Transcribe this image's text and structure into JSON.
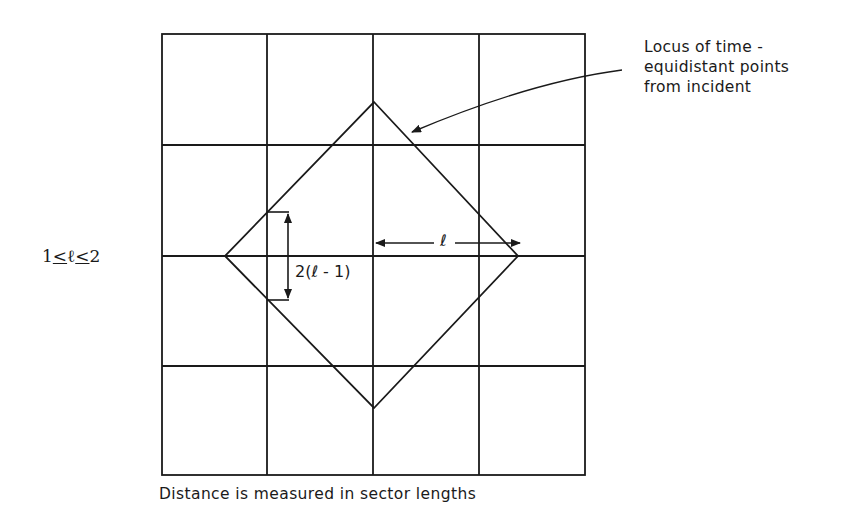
{
  "diagram": {
    "grid": {
      "columns": 4,
      "rows": 4,
      "line_color": "#1a1a1a",
      "x_lines": [
        162,
        267,
        373,
        479,
        585
      ],
      "y_lines": [
        34,
        145,
        256,
        366,
        475
      ]
    },
    "diamond": {
      "description": "Locus of time-equidistant points",
      "vertices": {
        "top": [
          374,
          102
        ],
        "right": [
          518,
          256
        ],
        "bottom": [
          374,
          408
        ],
        "left": [
          225,
          256
        ]
      }
    },
    "annotation": {
      "line1": "Locus of time -",
      "line2": "equidistant points",
      "line3": "from incident"
    },
    "condition": {
      "left": "1",
      "le1": "<",
      "var": "ℓ",
      "le2": "<",
      "right": "2"
    },
    "radius_label": "ℓ",
    "bracket_label": "2(ℓ - 1)",
    "caption": "Distance is measured in sector lengths"
  }
}
